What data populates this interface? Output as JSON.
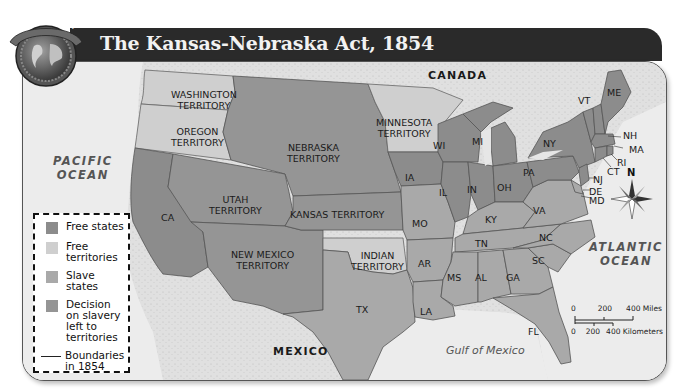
{
  "header": {
    "badge_text": "MAP SKILL",
    "title": "The Kansas-Nebraska Act, 1854"
  },
  "colors": {
    "free_states": "#8c8c8c",
    "free_territories": "#cfcfcf",
    "slave_states": "#a9a9a9",
    "decision_territories": "#959595",
    "water": "#ececec",
    "foreign_land": "#dcdcdc",
    "title_bar": "#2a2a2a"
  },
  "labels": {
    "canada": "CANADA",
    "mexico": "MEXICO",
    "pacific": [
      "PACIFIC",
      "OCEAN"
    ],
    "atlantic": [
      "ATLANTIC",
      "OCEAN"
    ],
    "gulf": "Gulf of Mexico",
    "territories": {
      "washington": [
        "WASHINGTON",
        "TERRITORY"
      ],
      "oregon": [
        "OREGON",
        "TERRITORY"
      ],
      "nebraska": [
        "NEBRASKA",
        "TERRITORY"
      ],
      "minnesota": [
        "MINNESOTA",
        "TERRITORY"
      ],
      "utah": [
        "UTAH",
        "TERRITORY"
      ],
      "kansas": "KANSAS TERRITORY",
      "new_mexico": [
        "NEW MEXICO",
        "TERRITORY"
      ],
      "indian": [
        "INDIAN",
        "TERRITORY"
      ]
    },
    "states": [
      "CA",
      "TX",
      "IA",
      "MO",
      "AR",
      "LA",
      "WI",
      "MI",
      "IL",
      "IN",
      "OH",
      "KY",
      "TN",
      "MS",
      "AL",
      "GA",
      "FL",
      "SC",
      "NC",
      "VA",
      "PA",
      "NY",
      "VT",
      "ME",
      "NH",
      "MA",
      "RI",
      "CT",
      "NJ",
      "DE",
      "MD"
    ]
  },
  "legend": {
    "items": [
      {
        "label": "Free states",
        "type": "free_states"
      },
      {
        "label": "Free territories",
        "type": "free_territories"
      },
      {
        "label": "Slave states",
        "type": "slave_states"
      },
      {
        "label": "Decision on slavery left to territories",
        "type": "decision_territories"
      },
      {
        "label": "Boundaries in 1854",
        "type": "boundary_line"
      }
    ]
  },
  "scale": {
    "miles": [
      "0",
      "200",
      "400 Miles"
    ],
    "km": [
      "0",
      "200",
      "400 Kilometers"
    ]
  },
  "compass": {
    "north_label": "N"
  }
}
